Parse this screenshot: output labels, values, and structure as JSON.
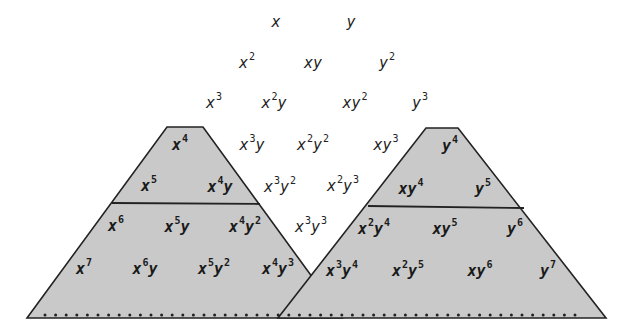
{
  "colors": {
    "fill": "#c9c9c9",
    "stroke": "#222222",
    "text": "#222222",
    "background": "#ffffff"
  },
  "terms": [
    {
      "id": "x",
      "base": "x",
      "exp": "",
      "tail": "",
      "tail_exp": "",
      "x": 276,
      "y": 22,
      "inside": false
    },
    {
      "id": "y",
      "base": "y",
      "exp": "",
      "tail": "",
      "tail_exp": "",
      "x": 351,
      "y": 22,
      "inside": false
    },
    {
      "id": "x2",
      "base": "x",
      "exp": "2",
      "tail": "",
      "tail_exp": "",
      "x": 247,
      "y": 62,
      "inside": false
    },
    {
      "id": "xy",
      "base": "xy",
      "exp": "",
      "tail": "",
      "tail_exp": "",
      "x": 313,
      "y": 63,
      "inside": false
    },
    {
      "id": "y2",
      "base": "y",
      "exp": "2",
      "tail": "",
      "tail_exp": "",
      "x": 387,
      "y": 62,
      "inside": false
    },
    {
      "id": "x3",
      "base": "x",
      "exp": "3",
      "tail": "",
      "tail_exp": "",
      "x": 214,
      "y": 102,
      "inside": false
    },
    {
      "id": "x2y",
      "base": "x",
      "exp": "2",
      "tail": "y",
      "tail_exp": "",
      "x": 274,
      "y": 102,
      "inside": false
    },
    {
      "id": "xy2",
      "base": "xy",
      "exp": "2",
      "tail": "",
      "tail_exp": "",
      "x": 355,
      "y": 102,
      "inside": false
    },
    {
      "id": "y3",
      "base": "y",
      "exp": "3",
      "tail": "",
      "tail_exp": "",
      "x": 420,
      "y": 102,
      "inside": false
    },
    {
      "id": "x4",
      "base": "x",
      "exp": "4",
      "tail": "",
      "tail_exp": "",
      "x": 180,
      "y": 144,
      "inside": true
    },
    {
      "id": "x3y",
      "base": "x",
      "exp": "3",
      "tail": "y",
      "tail_exp": "",
      "x": 252,
      "y": 144,
      "inside": false
    },
    {
      "id": "x2y2",
      "base": "x",
      "exp": "2",
      "tail": "y",
      "tail_exp": "2",
      "x": 313,
      "y": 144,
      "inside": false
    },
    {
      "id": "xy3",
      "base": "xy",
      "exp": "3",
      "tail": "",
      "tail_exp": "",
      "x": 386,
      "y": 144,
      "inside": false
    },
    {
      "id": "y4",
      "base": "y",
      "exp": "4",
      "tail": "",
      "tail_exp": "",
      "x": 450,
      "y": 145,
      "inside": true
    },
    {
      "id": "x5",
      "base": "x",
      "exp": "5",
      "tail": "",
      "tail_exp": "",
      "x": 149,
      "y": 185,
      "inside": true
    },
    {
      "id": "x4y",
      "base": "x",
      "exp": "4",
      "tail": "y",
      "tail_exp": "",
      "x": 220,
      "y": 186,
      "inside": true
    },
    {
      "id": "x3y2",
      "base": "x",
      "exp": "3",
      "tail": "y",
      "tail_exp": "2",
      "x": 280,
      "y": 186,
      "inside": false
    },
    {
      "id": "x2y3",
      "base": "x",
      "exp": "2",
      "tail": "y",
      "tail_exp": "3",
      "x": 343,
      "y": 185,
      "inside": false
    },
    {
      "id": "xy4",
      "base": "xy",
      "exp": "4",
      "tail": "",
      "tail_exp": "",
      "x": 411,
      "y": 188,
      "inside": true
    },
    {
      "id": "y5",
      "base": "y",
      "exp": "5",
      "tail": "",
      "tail_exp": "",
      "x": 483,
      "y": 188,
      "inside": true
    },
    {
      "id": "x6",
      "base": "x",
      "exp": "6",
      "tail": "",
      "tail_exp": "",
      "x": 116,
      "y": 225,
      "inside": true
    },
    {
      "id": "x5y",
      "base": "x",
      "exp": "5",
      "tail": "y",
      "tail_exp": "",
      "x": 177,
      "y": 226,
      "inside": true
    },
    {
      "id": "x4y2",
      "base": "x",
      "exp": "4",
      "tail": "y",
      "tail_exp": "2",
      "x": 245,
      "y": 226,
      "inside": true
    },
    {
      "id": "x3y3",
      "base": "x",
      "exp": "3",
      "tail": "y",
      "tail_exp": "3",
      "x": 311,
      "y": 226,
      "inside": false
    },
    {
      "id": "x2y4",
      "base": "x",
      "exp": "2",
      "tail": "y",
      "tail_exp": "4",
      "x": 374,
      "y": 228,
      "inside": true
    },
    {
      "id": "xy5",
      "base": "xy",
      "exp": "5",
      "tail": "",
      "tail_exp": "",
      "x": 445,
      "y": 228,
      "inside": true
    },
    {
      "id": "y6",
      "base": "y",
      "exp": "6",
      "tail": "",
      "tail_exp": "",
      "x": 515,
      "y": 228,
      "inside": true
    },
    {
      "id": "x7",
      "base": "x",
      "exp": "7",
      "tail": "",
      "tail_exp": "",
      "x": 84,
      "y": 268,
      "inside": true
    },
    {
      "id": "x6y",
      "base": "x",
      "exp": "6",
      "tail": "y",
      "tail_exp": "",
      "x": 145,
      "y": 268,
      "inside": true
    },
    {
      "id": "x5y2",
      "base": "x",
      "exp": "5",
      "tail": "y",
      "tail_exp": "2",
      "x": 214,
      "y": 268,
      "inside": true
    },
    {
      "id": "x4y3",
      "base": "x",
      "exp": "4",
      "tail": "y",
      "tail_exp": "3",
      "x": 278,
      "y": 268,
      "inside": true
    },
    {
      "id": "x3y4",
      "base": "x",
      "exp": "3",
      "tail": "y",
      "tail_exp": "4",
      "x": 342,
      "y": 270,
      "inside": true
    },
    {
      "id": "x2y5",
      "base": "x",
      "exp": "2",
      "tail": "y",
      "tail_exp": "5",
      "x": 408,
      "y": 270,
      "inside": true
    },
    {
      "id": "xy6",
      "base": "xy",
      "exp": "6",
      "tail": "",
      "tail_exp": "",
      "x": 480,
      "y": 270,
      "inside": true
    },
    {
      "id": "y7",
      "base": "y",
      "exp": "7",
      "tail": "",
      "tail_exp": "",
      "x": 548,
      "y": 270,
      "inside": true
    }
  ],
  "shapes": {
    "left_trapezoid": "167,127 203,127 342,318 27,318",
    "right_trapezoid": "426,128 458,128 606,318 278,318",
    "left_divider": [
      112,
      203,
      260,
      204
    ],
    "right_divider": [
      368,
      206,
      524,
      208
    ],
    "baseline": {
      "x1": 45,
      "x2": 578,
      "y": 315,
      "dot_spacing": 10.6
    }
  }
}
